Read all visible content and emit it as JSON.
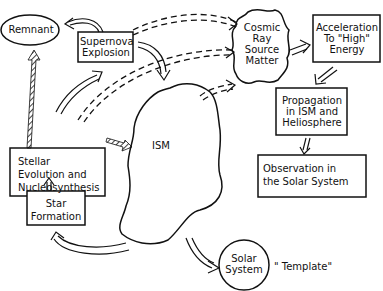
{
  "diagram": {
    "nodes": {
      "remnant": {
        "label": "Remnant",
        "shape": "ellipse"
      },
      "supernova": {
        "label": "Supernova\nExplosion",
        "shape": "box"
      },
      "cosmic_ray": {
        "label": "Cosmic\nRay\nSource\nMatter",
        "shape": "cloud"
      },
      "acceleration": {
        "label": "Acceleration\nTo \"High\"\nEnergy",
        "shape": "box"
      },
      "propagation": {
        "label": "Propagation\nin ISM and\nHeliosphere",
        "shape": "box"
      },
      "observation": {
        "label": "Observation in\nthe Solar System",
        "shape": "box"
      },
      "ism": {
        "label": "ISM",
        "shape": "blob"
      },
      "stellar": {
        "label": "Stellar\nEvolution  and\nNucleosynthesis",
        "shape": "box"
      },
      "star_formation": {
        "label": "Star\nFormation",
        "shape": "box"
      },
      "solar_system": {
        "label": "Solar\nSystem",
        "shape": "circle"
      },
      "template_note": {
        "label": "\" Template\""
      }
    },
    "edges": [
      {
        "from": "supernova",
        "to": "remnant",
        "style": "hollow-arrow"
      },
      {
        "from": "stellar",
        "to": "remnant",
        "style": "hatched-arrow"
      },
      {
        "from": "stellar",
        "to": "supernova",
        "style": "hollow-arrow"
      },
      {
        "from": "supernova",
        "to": "ism",
        "style": "hollow-arrow"
      },
      {
        "from": "supernova",
        "to": "cosmic_ray",
        "style": "dashed-arrow"
      },
      {
        "from": "stellar",
        "to": "cosmic_ray",
        "style": "dashed-arrow"
      },
      {
        "from": "ism",
        "to": "cosmic_ray",
        "style": "dashed-arrow"
      },
      {
        "from": "stellar",
        "to": "ism",
        "style": "hatched-arrow"
      },
      {
        "from": "cosmic_ray",
        "to": "acceleration",
        "style": "hollow-arrow"
      },
      {
        "from": "acceleration",
        "to": "propagation",
        "style": "hollow-arrow"
      },
      {
        "from": "propagation",
        "to": "observation",
        "style": "hollow-arrow"
      },
      {
        "from": "star_formation",
        "to": "stellar",
        "style": "hollow-arrow"
      },
      {
        "from": "ism",
        "to": "star_formation",
        "style": "hollow-arrow"
      },
      {
        "from": "ism",
        "to": "solar_system",
        "style": "hollow-arrow"
      }
    ]
  }
}
